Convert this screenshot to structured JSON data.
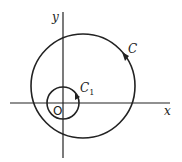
{
  "diagram": {
    "type": "contour-diagram",
    "colors": {
      "stroke": "#222222",
      "background": "#ffffff"
    },
    "axes": {
      "x_label": "x",
      "y_label": "y",
      "origin_label": "O"
    },
    "curves": [
      {
        "id": "C",
        "label": "C",
        "subscript": "",
        "shape": "circle",
        "orientation": "counterclockwise",
        "encloses_origin": true
      },
      {
        "id": "C1",
        "label": "C",
        "subscript": "1",
        "shape": "circle",
        "orientation": "counterclockwise",
        "centered_at_origin": true
      }
    ]
  }
}
